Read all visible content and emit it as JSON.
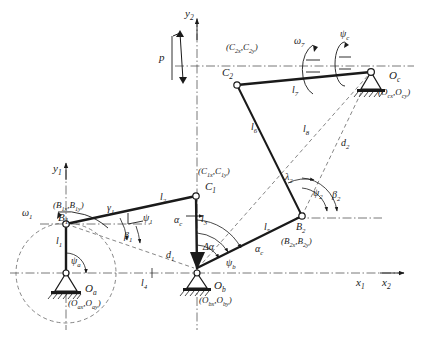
{
  "figure": {
    "type": "kinematic-linkage-diagram",
    "line_color": "#1a1a1a",
    "accent_color": "#555555",
    "background": "#ffffff",
    "width": 422,
    "height": 345
  },
  "axes": [
    {
      "name": "y1-axis",
      "label": "y",
      "sub": "1"
    },
    {
      "name": "y2-axis",
      "label": "y",
      "sub": "2"
    },
    {
      "name": "x1-axis",
      "label": "x",
      "sub": "1"
    },
    {
      "name": "x2-axis",
      "label": "x",
      "sub": "2"
    }
  ],
  "joints": [
    {
      "id": "Oa",
      "label": "O",
      "sub": "a",
      "coords": "(O",
      "coords_sub1": "ax",
      "coords_mid": ",O",
      "coords_sub2": "ay",
      "coords_end": ")",
      "coords_full": "(Oax,Oay)",
      "type": "fixed-pivot"
    },
    {
      "id": "Ob",
      "label": "O",
      "sub": "b",
      "coords_full": "(Obx,Oby)",
      "type": "fixed-pivot"
    },
    {
      "id": "Oc",
      "label": "O",
      "sub": "c",
      "coords_full": "(Ocx,Ocy)",
      "type": "fixed-pivot"
    },
    {
      "id": "B1",
      "label": "B",
      "sub": "1",
      "coords_full": "(B1x,B1y)",
      "type": "moving-pivot"
    },
    {
      "id": "B2",
      "label": "B",
      "sub": "2",
      "coords_full": "(B2x,B2y)",
      "type": "moving-pivot"
    },
    {
      "id": "C1",
      "label": "C",
      "sub": "1",
      "coords_full": "(C1x,C1y)",
      "type": "moving-pivot"
    },
    {
      "id": "C2",
      "label": "C",
      "sub": "2",
      "coords_full": "(C2x,C2y)",
      "type": "moving-pivot"
    }
  ],
  "links": [
    {
      "id": "l1",
      "label": "l",
      "sub": "1"
    },
    {
      "id": "l2",
      "label": "l",
      "sub": "2"
    },
    {
      "id": "l3",
      "label": "l",
      "sub": "3"
    },
    {
      "id": "l4",
      "label": "l",
      "sub": "4"
    },
    {
      "id": "l5",
      "label": "l",
      "sub": "5"
    },
    {
      "id": "l6",
      "label": "l",
      "sub": "6"
    },
    {
      "id": "l7",
      "label": "l",
      "sub": "7"
    },
    {
      "id": "l8",
      "label": "l",
      "sub": "8"
    }
  ],
  "diagonals": [
    {
      "id": "d1",
      "label": "d",
      "sub": "1"
    },
    {
      "id": "d2",
      "label": "d",
      "sub": "2"
    }
  ],
  "angles": [
    {
      "id": "psi_a",
      "label": "ψ",
      "sub": "a"
    },
    {
      "id": "psi_b",
      "label": "ψ",
      "sub": "b"
    },
    {
      "id": "psi_c",
      "label": "ψ",
      "sub": "c"
    },
    {
      "id": "psi_1",
      "label": "ψ",
      "sub": "1"
    },
    {
      "id": "psi_2",
      "label": "ψ",
      "sub": "2"
    },
    {
      "id": "beta_1",
      "label": "β",
      "sub": "1"
    },
    {
      "id": "beta_2",
      "label": "β",
      "sub": "2"
    },
    {
      "id": "gamma_1",
      "label": "γ",
      "sub": "1"
    },
    {
      "id": "lambda_2",
      "label": "λ",
      "sub": "2"
    },
    {
      "id": "alpha_c_upper",
      "label": "α",
      "sub": "c"
    },
    {
      "id": "alpha_c_lower",
      "label": "α",
      "sub": "c"
    },
    {
      "id": "delta_alpha",
      "label": "Δα",
      "sub": ""
    }
  ],
  "velocities": [
    {
      "id": "omega_1",
      "label": "ω",
      "sub": "1",
      "sense": "counterclockwise"
    },
    {
      "id": "omega_7",
      "label": "ω",
      "sub": "7",
      "sense": "counterclockwise"
    }
  ],
  "force": {
    "id": "p",
    "label": "p",
    "direction": "vertical-double-arrow"
  }
}
